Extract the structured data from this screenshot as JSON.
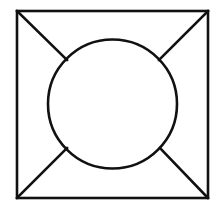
{
  "diagram": {
    "background": "#ffffff",
    "stroke_color": "#111111",
    "stroke_width": 2.6,
    "square": {
      "x1": 17,
      "y1": 11,
      "x2": 208,
      "y2": 198
    },
    "circle": {
      "cx": 112.5,
      "cy": 104,
      "r": 64.5
    },
    "connectors": [
      {
        "name": "top-left-connector",
        "x1": 17,
        "y1": 11,
        "x2": 67,
        "y2": 60
      },
      {
        "name": "top-right-connector",
        "x1": 208,
        "y1": 11,
        "x2": 159,
        "y2": 60
      },
      {
        "name": "bottom-left-connector",
        "x1": 17,
        "y1": 198,
        "x2": 67,
        "y2": 148
      },
      {
        "name": "bottom-right-connector",
        "x1": 208,
        "y1": 198,
        "x2": 160,
        "y2": 148
      }
    ]
  }
}
